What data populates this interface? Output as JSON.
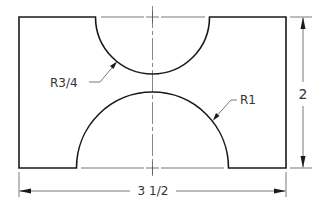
{
  "drawing": {
    "title": "Part with semicircular cutouts",
    "units_px_per_inch": 76.3,
    "colors": {
      "object_line": "#1a1a1a",
      "thin_line": "#555555",
      "text": "#333333"
    },
    "outline": {
      "left": 19,
      "right": 286,
      "top": 17,
      "bottom": 168
    },
    "top_cutout": {
      "center_x": 152.5,
      "center_y": 17,
      "radius": 57,
      "label": "R3/4"
    },
    "bottom_cutout": {
      "center_x": 152.5,
      "center_y": 168,
      "radius": 76,
      "label": "R1"
    }
  },
  "dimensions": {
    "width": {
      "label": "3 1/2",
      "value_in": 3.5,
      "line_y": 191
    },
    "height": {
      "label": "2",
      "value_in": 2,
      "line_x": 303
    }
  },
  "leaders": {
    "r34": {
      "text": "R3/4",
      "text_x": 50,
      "text_y": 85
    },
    "r1": {
      "text": "R1",
      "text_x": 239,
      "text_y": 104
    }
  }
}
